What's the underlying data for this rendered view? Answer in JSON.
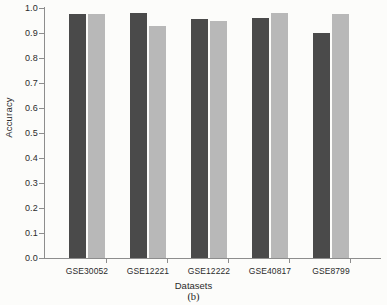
{
  "chart_data": {
    "type": "bar",
    "title": "",
    "subcaption": "(b)",
    "xlabel": "Datasets",
    "ylabel": "Accuracy",
    "categories": [
      "GSE30052",
      "GSE12221",
      "GSE12222",
      "GSE40817",
      "GSE8799"
    ],
    "series": [
      {
        "name": "series-a",
        "color": "#4a4a4a",
        "values": [
          0.975,
          0.98,
          0.955,
          0.96,
          0.9
        ]
      },
      {
        "name": "series-b",
        "color": "#b8b8b8",
        "values": [
          0.975,
          0.93,
          0.95,
          0.98,
          0.975
        ]
      }
    ],
    "ylim": [
      0.0,
      1.0
    ],
    "yticks": [
      "0.0",
      "0.1",
      "0.2",
      "0.3",
      "0.4",
      "0.5",
      "0.6",
      "0.7",
      "0.8",
      "0.9",
      "1.0"
    ],
    "ytick_values": [
      0.0,
      0.1,
      0.2,
      0.3,
      0.4,
      0.5,
      0.6,
      0.7,
      0.8,
      0.9,
      1.0
    ],
    "grid": false,
    "legend": "none"
  },
  "colors": {
    "background": "#fcfcfa",
    "axis": "#8d8d8d",
    "text": "#2b2b2b",
    "series_a": "#4a4a4a",
    "series_b": "#b8b8b8"
  }
}
